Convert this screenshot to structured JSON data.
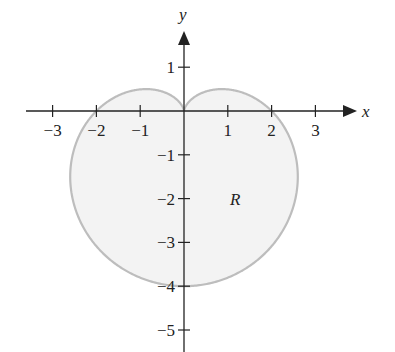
{
  "chart_data": {
    "type": "line",
    "title": "",
    "curve": "cardioid r = 2 - 2 sin(theta)",
    "polar": {
      "a": 2,
      "b": -2,
      "func": "sin"
    },
    "region_label": "R",
    "xlabel": "x",
    "ylabel": "y",
    "xlim": [
      -3.6,
      3.9
    ],
    "ylim": [
      -5.5,
      1.8
    ],
    "x_ticks": [
      -3,
      -2,
      -1,
      1,
      2,
      3
    ],
    "x_tick_labels": [
      "−3",
      "−2",
      "−1",
      "1",
      "2",
      "3"
    ],
    "y_ticks": [
      1,
      -1,
      -2,
      -3,
      -4,
      -5
    ],
    "y_tick_labels": [
      "1",
      "−1",
      "−2",
      "−3",
      "−4",
      "−5"
    ],
    "grid": false,
    "fill_color": "#f3f3f3",
    "curve_color": "#bdbdbd",
    "axis_color": "#222222"
  },
  "layout": {
    "origin_px": [
      184,
      111
    ],
    "unit_px": 43.8
  }
}
